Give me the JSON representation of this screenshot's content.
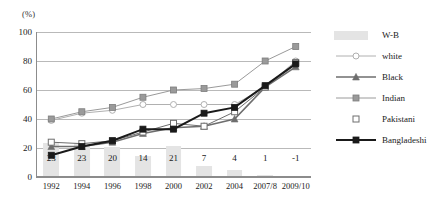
{
  "chart_data": {
    "type": "line",
    "title": "",
    "xlabel": "",
    "ylabel": "(%)",
    "ylim": [
      0,
      100
    ],
    "yticks": [
      0,
      20,
      40,
      60,
      80,
      100
    ],
    "grid": true,
    "legend_position": "right",
    "categories": [
      "1992",
      "1994",
      "1996",
      "1998",
      "2000",
      "2002",
      "2004",
      "2007/8",
      "2009/10"
    ],
    "bar_series": {
      "name": "W-B",
      "values": [
        23,
        23,
        20,
        14,
        21,
        7,
        4,
        1,
        -1
      ],
      "color": "#e4e4e4",
      "labels": [
        "23",
        "23",
        "20",
        "14",
        "21",
        "7",
        "4",
        "1",
        "-1"
      ]
    },
    "series": [
      {
        "name": "white",
        "marker": "circle-open",
        "color": "#b0b0b0",
        "values": [
          39,
          44,
          46,
          50,
          50,
          50,
          50,
          62,
          80
        ]
      },
      {
        "name": "Black",
        "marker": "triangle",
        "color": "#6e6e6e",
        "values": [
          21,
          21,
          24,
          30,
          34,
          35,
          40,
          62,
          76
        ]
      },
      {
        "name": "Indian",
        "marker": "square",
        "color": "#9a9a9a",
        "values": [
          40,
          45,
          48,
          55,
          60,
          61,
          64,
          80,
          90
        ]
      },
      {
        "name": "Pakistani",
        "marker": "square-open",
        "color": "#6e6e6e",
        "values": [
          24,
          23,
          25,
          31,
          37,
          35,
          45,
          62,
          79
        ]
      },
      {
        "name": "Bangladeshi",
        "marker": "square-filled",
        "color": "#1a1a1a",
        "values": [
          15,
          21,
          25,
          33,
          33,
          44,
          48,
          63,
          78
        ]
      }
    ]
  },
  "legend": {
    "items": [
      {
        "label": "W-B",
        "key": "wb-bar-swatch"
      },
      {
        "label": "white",
        "key": "white-circle-marker"
      },
      {
        "label": "Black",
        "key": "black-triangle-marker"
      },
      {
        "label": "Indian",
        "key": "indian-square-marker"
      },
      {
        "label": "Pakistani",
        "key": "pakistani-open-square-marker"
      },
      {
        "label": "Bangladeshi",
        "key": "bangladeshi-filled-square-marker"
      }
    ]
  }
}
